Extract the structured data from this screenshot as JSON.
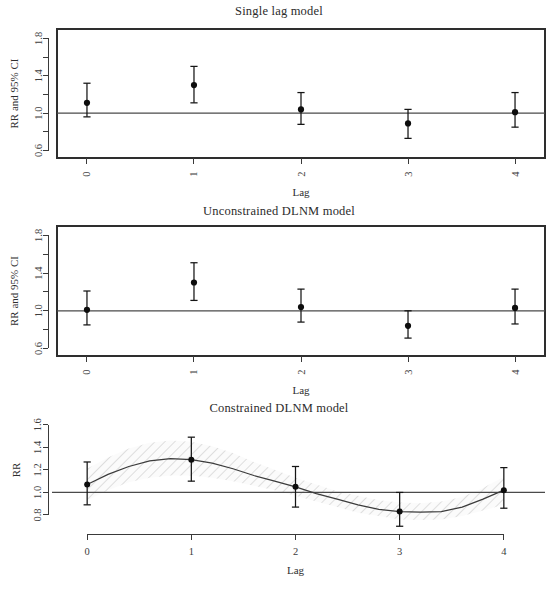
{
  "figure": {
    "width": 558,
    "height": 595,
    "background": "#ffffff",
    "line_color": "#2e2e2e",
    "point_color": "#0d0d0d",
    "band_color": "#cfcfcf"
  },
  "chart_data": [
    {
      "type": "scatter",
      "title": "Single lag model",
      "xlabel": "Lag",
      "ylabel": "RR and 95% CI",
      "x": [
        0,
        1,
        2,
        3,
        4
      ],
      "xtick_labels": [
        "0",
        "1",
        "2",
        "3",
        "4"
      ],
      "xlim": [
        -0.28,
        4.28
      ],
      "ylim": [
        0.52,
        1.9
      ],
      "ytick_values": [
        0.6,
        0.8,
        1.0,
        1.2,
        1.4,
        1.6,
        1.8
      ],
      "ytick_labels": [
        "0.6",
        "",
        "1.0",
        "",
        "1.4",
        "",
        "1.8"
      ],
      "reference_line": 1.0,
      "grid": false,
      "legend": "none",
      "series": [
        {
          "name": "RR",
          "values": [
            1.11,
            1.3,
            1.04,
            0.89,
            1.01
          ],
          "ci_lower": [
            0.96,
            1.11,
            0.88,
            0.73,
            0.85
          ],
          "ci_upper": [
            1.32,
            1.5,
            1.22,
            1.04,
            1.22
          ]
        }
      ]
    },
    {
      "type": "scatter",
      "title": "Unconstrained DLNM model",
      "xlabel": "Lag",
      "ylabel": "RR and 95% CI",
      "x": [
        0,
        1,
        2,
        3,
        4
      ],
      "xtick_labels": [
        "0",
        "1",
        "2",
        "3",
        "4"
      ],
      "xlim": [
        -0.28,
        4.28
      ],
      "ylim": [
        0.52,
        1.9
      ],
      "ytick_values": [
        0.6,
        0.8,
        1.0,
        1.2,
        1.4,
        1.6,
        1.8
      ],
      "ytick_labels": [
        "0.6",
        "",
        "1.0",
        "",
        "1.4",
        "",
        "1.8"
      ],
      "reference_line": 1.0,
      "grid": false,
      "legend": "none",
      "series": [
        {
          "name": "RR",
          "values": [
            1.01,
            1.3,
            1.04,
            0.84,
            1.03
          ],
          "ci_lower": [
            0.85,
            1.11,
            0.88,
            0.71,
            0.86
          ],
          "ci_upper": [
            1.21,
            1.51,
            1.23,
            1.0,
            1.23
          ]
        }
      ]
    },
    {
      "type": "line",
      "title": "Constrained DLNM model",
      "xlabel": "Lag",
      "ylabel": "RR",
      "x": [
        0,
        1,
        2,
        3,
        4
      ],
      "xtick_labels": [
        "0",
        "1",
        "2",
        "3",
        "4"
      ],
      "xlim": [
        -0.28,
        4.28
      ],
      "ylim": [
        0.72,
        1.66
      ],
      "ytick_values": [
        0.8,
        1.0,
        1.2,
        1.4,
        1.6
      ],
      "ytick_labels": [
        "0.8",
        "1.0",
        "1.2",
        "1.4",
        "1.6"
      ],
      "reference_line": 1.0,
      "grid": false,
      "legend": "none",
      "band_style": "hatched",
      "series": [
        {
          "name": "RR point estimate",
          "values": [
            1.07,
            1.29,
            1.05,
            0.83,
            1.02
          ],
          "ci_lower": [
            0.89,
            1.1,
            0.87,
            0.7,
            0.86
          ],
          "ci_upper": [
            1.27,
            1.49,
            1.23,
            1.0,
            1.22
          ]
        },
        {
          "name": "Fitted spline",
          "x_fine": [
            0,
            0.2,
            0.4,
            0.6,
            0.8,
            1.0,
            1.2,
            1.4,
            1.6,
            1.8,
            2.0,
            2.2,
            2.4,
            2.6,
            2.8,
            3.0,
            3.2,
            3.4,
            3.6,
            3.8,
            4.0
          ],
          "y_fine": [
            1.07,
            1.16,
            1.23,
            1.28,
            1.3,
            1.29,
            1.26,
            1.21,
            1.15,
            1.1,
            1.05,
            0.99,
            0.94,
            0.89,
            0.85,
            0.83,
            0.825,
            0.83,
            0.87,
            0.94,
            1.02
          ],
          "band_lower": [
            0.93,
            1.02,
            1.09,
            1.13,
            1.15,
            1.15,
            1.13,
            1.1,
            1.06,
            1.02,
            0.97,
            0.92,
            0.87,
            0.82,
            0.79,
            0.76,
            0.755,
            0.76,
            0.79,
            0.84,
            0.89
          ],
          "band_upper": [
            1.21,
            1.31,
            1.39,
            1.44,
            1.46,
            1.45,
            1.41,
            1.35,
            1.27,
            1.2,
            1.13,
            1.07,
            1.01,
            0.97,
            0.93,
            0.91,
            0.905,
            0.92,
            0.96,
            1.04,
            1.14
          ]
        }
      ]
    }
  ]
}
